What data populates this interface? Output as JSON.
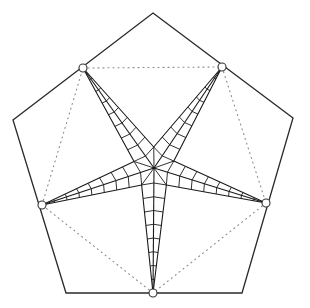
{
  "figure": {
    "stroke_color": "#2a2a2a",
    "dotted_color": "#8a8a8a",
    "background": "#ffffff"
  },
  "geometry": {
    "pentagon": [
      [
        153,
        13
      ],
      [
        293,
        118
      ],
      [
        242,
        293
      ],
      [
        66,
        293
      ],
      [
        13,
        120
      ]
    ],
    "center": [
      154,
      168
    ],
    "inner_radius": 21,
    "tips": [
      [
        222,
        67
      ],
      [
        266,
        203
      ],
      [
        153,
        293
      ],
      [
        42,
        205
      ],
      [
        83,
        68
      ]
    ],
    "ribs_per_arm": 8
  }
}
